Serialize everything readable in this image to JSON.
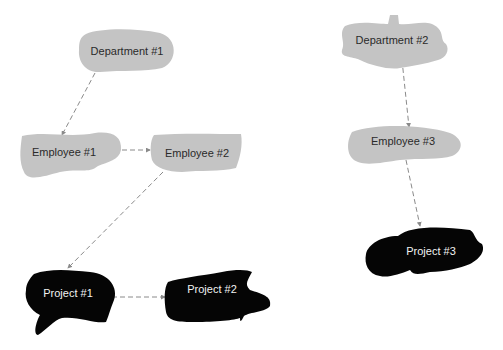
{
  "colors": {
    "gray_node": "#c4c4c4",
    "black_node": "#050505",
    "edge": "#8a8a8a",
    "background": "#ffffff"
  },
  "nodes": [
    {
      "id": "department-1",
      "label": "Department #1",
      "kind": "gray"
    },
    {
      "id": "employee-1",
      "label": "Employee #1",
      "kind": "gray"
    },
    {
      "id": "employee-2",
      "label": "Employee #2",
      "kind": "gray"
    },
    {
      "id": "project-1",
      "label": "Project #1",
      "kind": "black"
    },
    {
      "id": "project-2",
      "label": "Project #2",
      "kind": "black"
    },
    {
      "id": "department-2",
      "label": "Department #2",
      "kind": "gray"
    },
    {
      "id": "employee-3",
      "label": "Employee #3",
      "kind": "gray"
    },
    {
      "id": "project-3",
      "label": "Project #3",
      "kind": "black"
    }
  ],
  "edges": [
    {
      "from": "Department #1",
      "to": "Employee #1"
    },
    {
      "from": "Employee #1",
      "to": "Employee #2"
    },
    {
      "from": "Employee #2",
      "to": "Project #1"
    },
    {
      "from": "Project #1",
      "to": "Project #2"
    },
    {
      "from": "Department #2",
      "to": "Employee #3"
    },
    {
      "from": "Employee #3",
      "to": "Project #3"
    }
  ]
}
